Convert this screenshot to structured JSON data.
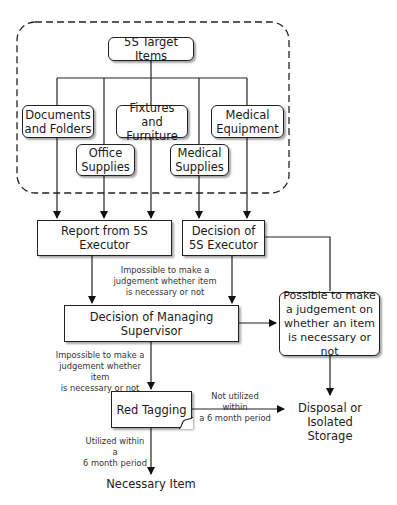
{
  "diagram": {
    "target_group": {
      "title": "5S Target Items",
      "items": [
        {
          "id": "documents",
          "label_line1": "Documents",
          "label_line2": "and Folders"
        },
        {
          "id": "office",
          "label_line1": "Office",
          "label_line2": "Supplies"
        },
        {
          "id": "fixtures",
          "label_line1": "Fixtures and",
          "label_line2": "Furniture"
        },
        {
          "id": "medical_supplies",
          "label_line1": "Medical",
          "label_line2": "Supplies"
        },
        {
          "id": "medical_equipment",
          "label_line1": "Medical",
          "label_line2": "Equipment"
        }
      ]
    },
    "nodes": {
      "report": "Report  from 5S Executor",
      "decision_exec_line1": "Decision of",
      "decision_exec_line2": "5S Executor",
      "decision_supervisor": "Decision of Managing Supervisor",
      "possible_line1": "Possible to make",
      "possible_line2": "a judgement on",
      "possible_line3": "whether an item",
      "possible_line4": "is necessary or not",
      "red_tagging": "Red Tagging",
      "disposal_line1": "Disposal or",
      "disposal_line2": "Isolated Storage",
      "necessary": "Necessary Item"
    },
    "edge_labels": {
      "impossible_1_line1": "Impossible to make a",
      "impossible_1_line2": "judgement whether item",
      "impossible_1_line3": "is necessary or not",
      "impossible_2_line1": "Impossible to make a",
      "impossible_2_line2": "judgement whether item",
      "impossible_2_line3": "is necessary or not",
      "not_utilized_line1": "Not utilized within",
      "not_utilized_line2": "a 6 month period",
      "utilized_line1": "Utilized within a",
      "utilized_line2": "6 month period"
    }
  }
}
